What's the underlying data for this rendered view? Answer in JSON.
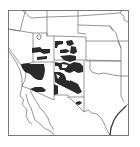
{
  "map": {
    "title": "Distribution range map — Southwestern United States",
    "region": "Southwestern United States and northern Mexico",
    "style": "black-and-white line map with filled range patches",
    "colors": {
      "background": "#ffffff",
      "border_line": "#6a6a6a",
      "frame": "#7a7a7a",
      "range_fill": "#2a2a2a"
    },
    "states_visible": [
      "Nevada",
      "Utah",
      "Colorado",
      "Arizona",
      "New Mexico",
      "Texas",
      "Oklahoma",
      "Kansas",
      "Nebraska",
      "Wyoming",
      "Idaho",
      "California"
    ],
    "range_areas": [
      {
        "name": "central-arizona-patch"
      },
      {
        "name": "southern-utah-patches"
      },
      {
        "name": "western-colorado-patches"
      },
      {
        "name": "new-mexico-patch"
      },
      {
        "name": "southeast-arizona-patch"
      },
      {
        "name": "west-texas-patch"
      }
    ]
  }
}
